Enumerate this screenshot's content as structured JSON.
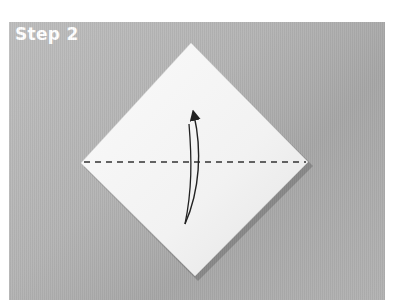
{
  "figure": {
    "step_label": "Step 2",
    "colors": {
      "background": "#b5b5b5",
      "paper": "#f4f4f4",
      "paper_shade": "#e6e6e6",
      "fold_line": "#333333",
      "arrow": "#222222",
      "label": "#ffffff"
    },
    "diamond": {
      "top": [
        191,
        43
      ],
      "right": [
        308,
        162
      ],
      "bottom": [
        195,
        276
      ],
      "left": [
        81,
        163
      ]
    },
    "fold_line": {
      "type": "valley-fold-dashed",
      "y": 162
    },
    "arrow": {
      "type": "fold-up-arrow",
      "direction": "bottom-to-top"
    }
  }
}
